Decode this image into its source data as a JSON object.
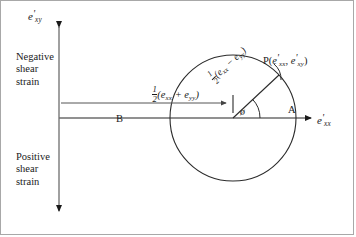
{
  "figure": {
    "type": "mohrs-circle-strain-diagram",
    "width": 356,
    "height": 237,
    "background_color": "#ffffff",
    "line_color": "#1a1a1a",
    "frame_color": "#a8a8a8"
  },
  "axes": {
    "y_label_text": "e",
    "y_label_prime": "'",
    "y_label_sub": "xy",
    "y_label_full": "e'xy",
    "x_label_text": "e",
    "x_label_prime": "'",
    "x_label_sub": "xx",
    "x_label_full": "e'xx",
    "origin_x": 59,
    "origin_y": 118,
    "y_axis_top": 20,
    "y_axis_bottom": 218,
    "x_axis_right": 313
  },
  "regions": {
    "upper_label_line1": "Negative",
    "upper_label_line2": "shear",
    "upper_label_line3": "strain",
    "lower_label_line1": "Positive",
    "lower_label_line2": "shear",
    "lower_label_line3": "strain"
  },
  "circle": {
    "center_x": 233,
    "center_y": 118,
    "radius": 63
  },
  "points": {
    "a_label": "A",
    "b_label": "B",
    "p_label_prefix": "P(",
    "p_label_e1": "e",
    "p_label_e1_prime": "'",
    "p_label_e1_sub": "xx",
    "p_label_comma": ", ",
    "p_label_e2": "e",
    "p_label_e2_prime": "'",
    "p_label_e2_sub": "xy",
    "p_label_suffix": ")",
    "p_label_full": "P(e'xx, e'xy)",
    "angle_symbol": "ø"
  },
  "annotations": {
    "mean_strain": {
      "fraction_numerator": "1",
      "fraction_denominator": "2",
      "expr_open": "(",
      "term1": "e",
      "term1_sub": "xx",
      "operator": " + ",
      "term2": "e",
      "term2_sub": "yy",
      "expr_close": ")",
      "full": "1/2(exx + eyy)"
    },
    "radius_strain": {
      "fraction_numerator": "1",
      "fraction_denominator": "2",
      "expr_open": "(",
      "term1": "e",
      "term1_sub": "xx",
      "operator": " − ",
      "term2": "e",
      "term2_sub": "yy",
      "expr_close": ")",
      "full": "1/2(exx − eyy)"
    }
  }
}
